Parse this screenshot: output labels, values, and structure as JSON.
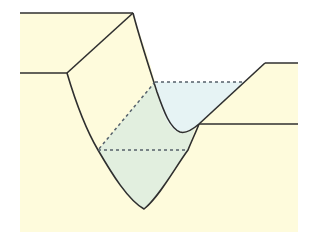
{
  "diagram": {
    "colors": {
      "page_background": "#ffffff",
      "ground": "#fefbdc",
      "upper_fill": "#e6f3f4",
      "lower_fill": "#e2efdf",
      "line": "#2f2f2f",
      "dashed": "#55606a"
    },
    "labels": []
  }
}
